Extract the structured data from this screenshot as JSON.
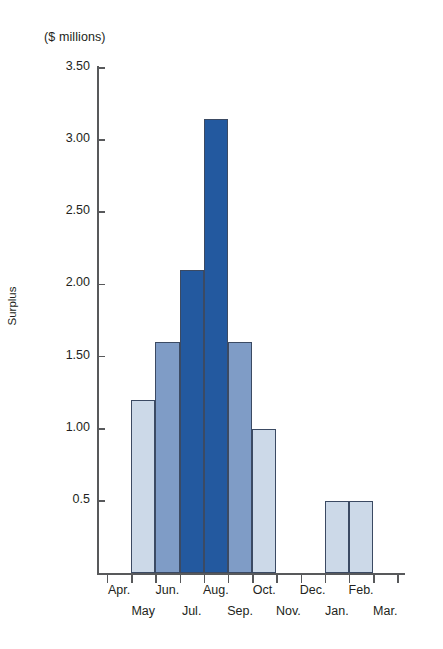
{
  "chart_data": {
    "type": "bar",
    "title": "",
    "subtitle": "",
    "units_label": "($ millions)",
    "ylabel": "Surplus",
    "xlabel": "",
    "grid": false,
    "legend": null,
    "ylim": [
      0,
      3.5
    ],
    "ytick_labels": [
      "3.50",
      "3.00",
      "2.50",
      "2.00",
      "1.50",
      "1.00",
      "0.5"
    ],
    "ytick_values": [
      3.5,
      3.0,
      2.5,
      2.0,
      1.5,
      1.0,
      0.5
    ],
    "categories": [
      "Apr.",
      "May",
      "Jun.",
      "Jul.",
      "Aug.",
      "Sep.",
      "Oct.",
      "Nov.",
      "Dec.",
      "Jan.",
      "Feb.",
      "Mar."
    ],
    "values": [
      0,
      1.2,
      1.6,
      2.1,
      3.15,
      1.6,
      1.0,
      0,
      0,
      0.5,
      0.5,
      0
    ],
    "series": [
      {
        "name": "Surplus",
        "values": [
          0,
          1.2,
          1.6,
          2.1,
          3.15,
          1.6,
          1.0,
          0,
          0,
          0.5,
          0.5,
          0
        ]
      }
    ],
    "bars": [
      {
        "category": "Apr.",
        "value": 0,
        "tone": "none"
      },
      {
        "category": "May",
        "value": 1.2,
        "tone": "light"
      },
      {
        "category": "Jun.",
        "value": 1.6,
        "tone": "mid"
      },
      {
        "category": "Jul.",
        "value": 2.1,
        "tone": "dark"
      },
      {
        "category": "Aug.",
        "value": 3.15,
        "tone": "dark"
      },
      {
        "category": "Sep.",
        "value": 1.6,
        "tone": "mid"
      },
      {
        "category": "Oct.",
        "value": 1.0,
        "tone": "light"
      },
      {
        "category": "Nov.",
        "value": 0,
        "tone": "none"
      },
      {
        "category": "Dec.",
        "value": 0,
        "tone": "none"
      },
      {
        "category": "Jan.",
        "value": 0.5,
        "tone": "light"
      },
      {
        "category": "Feb.",
        "value": 0.5,
        "tone": "light"
      },
      {
        "category": "Mar.",
        "value": 0,
        "tone": "none"
      }
    ],
    "colors": {
      "light": "#ccd9e8",
      "mid": "#7f9cc6",
      "dark": "#23599f",
      "outline": "#3b4a63",
      "axis": "#58595b",
      "text": "#231f20",
      "background": "#ffffff"
    }
  }
}
